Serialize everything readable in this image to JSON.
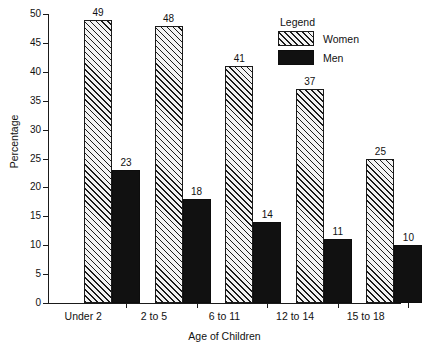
{
  "chart_data": {
    "type": "bar",
    "title": "",
    "xlabel": "Age of Children",
    "ylabel": "Percentage",
    "categories": [
      "Under 2",
      "2 to 5",
      "6 to 11",
      "12 to 14",
      "15 to 18"
    ],
    "series": [
      {
        "name": "Women",
        "values": [
          49,
          48,
          41,
          37,
          25
        ],
        "fill": "diagonal-hatch",
        "color": "#f2f2f2"
      },
      {
        "name": "Men",
        "values": [
          23,
          18,
          14,
          11,
          10
        ],
        "fill": "solid",
        "color": "#111111"
      }
    ],
    "ylim": [
      0,
      50
    ],
    "ytick_labels": [
      "0",
      "5",
      "10",
      "15",
      "20",
      "25",
      "30",
      "35",
      "40",
      "45",
      "50"
    ],
    "ytick_values": [
      0,
      5,
      10,
      15,
      20,
      25,
      30,
      35,
      40,
      45,
      50
    ],
    "grid": false,
    "legend_position": "top-right",
    "legend_title": "Legend",
    "value_labels_shown": true
  },
  "legend": {
    "title": "Legend",
    "entries": [
      {
        "label": "Women"
      },
      {
        "label": "Men"
      }
    ]
  },
  "axes": {
    "y_title": "Percentage",
    "x_title": "Age of Children"
  },
  "colors": {
    "axis": "#1a1a1a",
    "men_bar": "#111111",
    "women_bar": "#f2f2f2",
    "background": "#ffffff"
  }
}
